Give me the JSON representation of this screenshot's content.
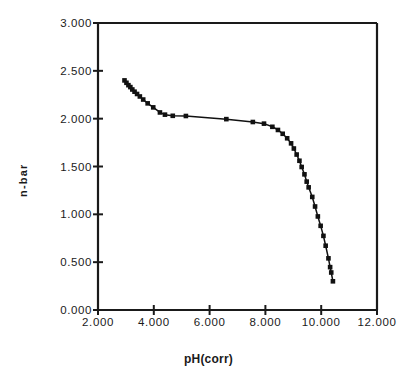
{
  "chart_data": {
    "type": "scatter",
    "title": "",
    "xlabel": "pH(corr)",
    "ylabel": "n-bar",
    "xlim": [
      2.0,
      12.0
    ],
    "ylim": [
      0.0,
      3.0
    ],
    "xticks": [
      "2.000",
      "4.000",
      "6.000",
      "8.000",
      "10.000",
      "12.000"
    ],
    "xtick_values": [
      2.0,
      4.0,
      6.0,
      8.0,
      10.0,
      12.0
    ],
    "yticks": [
      "0.000",
      "0.500",
      "1.000",
      "1.500",
      "2.000",
      "2.500",
      "3.000"
    ],
    "ytick_values": [
      0.0,
      0.5,
      1.0,
      1.5,
      2.0,
      2.5,
      3.0
    ],
    "grid": false,
    "legend": null,
    "marker": "square",
    "marker_color": "#111111",
    "line_color": "#111111",
    "series": [
      {
        "name": "n-bar vs pH(corr)",
        "points": [
          [
            2.95,
            2.4
          ],
          [
            3.02,
            2.375
          ],
          [
            3.09,
            2.35
          ],
          [
            3.16,
            2.33
          ],
          [
            3.23,
            2.305
          ],
          [
            3.31,
            2.282
          ],
          [
            3.4,
            2.258
          ],
          [
            3.5,
            2.232
          ],
          [
            3.62,
            2.2
          ],
          [
            3.78,
            2.16
          ],
          [
            3.98,
            2.118
          ],
          [
            4.22,
            2.065
          ],
          [
            4.4,
            2.042
          ],
          [
            4.68,
            2.03
          ],
          [
            5.15,
            2.028
          ],
          [
            6.6,
            1.995
          ],
          [
            7.55,
            1.965
          ],
          [
            7.95,
            1.948
          ],
          [
            8.25,
            1.915
          ],
          [
            8.45,
            1.882
          ],
          [
            8.62,
            1.842
          ],
          [
            8.78,
            1.795
          ],
          [
            8.92,
            1.742
          ],
          [
            9.02,
            1.688
          ],
          [
            9.12,
            1.625
          ],
          [
            9.22,
            1.56
          ],
          [
            9.3,
            1.495
          ],
          [
            9.4,
            1.418
          ],
          [
            9.48,
            1.342
          ],
          [
            9.55,
            1.282
          ],
          [
            9.68,
            1.182
          ],
          [
            9.78,
            1.082
          ],
          [
            9.88,
            0.978
          ],
          [
            9.98,
            0.88
          ],
          [
            10.08,
            0.775
          ],
          [
            10.16,
            0.672
          ],
          [
            10.26,
            0.54
          ],
          [
            10.32,
            0.448
          ],
          [
            10.36,
            0.392
          ],
          [
            10.42,
            0.3
          ]
        ]
      }
    ]
  },
  "axes": {
    "x_title": "pH(corr)",
    "y_title": "n-bar"
  }
}
